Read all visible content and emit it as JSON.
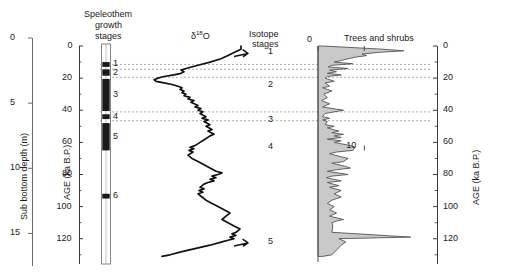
{
  "figure": {
    "headers": {
      "speleothem": [
        "Speleothem",
        "growth",
        "stages"
      ],
      "isotope_curve": "δ18O",
      "isotope_stages": [
        "Isotope",
        "stages"
      ],
      "pollen": "Trees and shrubs"
    },
    "axes": {
      "depth": {
        "label": "Sub bottom depth (m)",
        "ticks": [
          0,
          5,
          10,
          15
        ],
        "unit": "m",
        "range": [
          0,
          17.5
        ]
      },
      "age_left": {
        "label": "AGE (ka B.P.)",
        "ticks": [
          0,
          20,
          40,
          60,
          80,
          100,
          120
        ],
        "minor_ticks": [
          10,
          30,
          50,
          70,
          90,
          110,
          130
        ],
        "unit": "ka B.P.",
        "range": [
          0,
          132
        ]
      },
      "age_right": {
        "label": "AGE (ka B.P.)",
        "ticks": [
          0,
          20,
          40,
          60,
          80,
          100,
          120
        ],
        "minor_ticks": [
          10,
          30,
          50,
          70,
          90,
          110,
          130
        ],
        "unit": "ka B.P.",
        "range": [
          0,
          132
        ]
      },
      "pollen_x": {
        "ticks": [
          0,
          10
        ],
        "range": [
          0,
          22
        ]
      }
    },
    "growth_stages": {
      "numbers": [
        "1",
        "2",
        "3",
        "4",
        "5",
        "6"
      ],
      "bands": [
        {
          "label": "1",
          "top_age": 10.0,
          "bottom_age": 13.0,
          "fill": "#1a1a1a"
        },
        {
          "label": "2",
          "top_age": 14.5,
          "bottom_age": 18.5,
          "fill": "#1a1a1a"
        },
        {
          "label": "3",
          "top_age": 20.5,
          "bottom_age": 40.5,
          "fill": "#1a1a1a"
        },
        {
          "label": "4",
          "top_age": 42.5,
          "bottom_age": 45.5,
          "fill": "#1a1a1a"
        },
        {
          "label": "5",
          "top_age": 48.0,
          "bottom_age": 65.0,
          "fill": "#1a1a1a"
        },
        {
          "label": "6",
          "top_age": 92.0,
          "bottom_age": 95.0,
          "fill": "#1a1a1a"
        }
      ]
    },
    "isotope_stage_labels": [
      {
        "text": "1",
        "age": 4
      },
      {
        "text": "2",
        "age": 24
      },
      {
        "text": "3",
        "age": 46
      },
      {
        "text": "4",
        "age": 63
      },
      {
        "text": "5",
        "age": 122
      }
    ],
    "correlation_lines_age": [
      11.5,
      14.5,
      19.5,
      41.0,
      46.5
    ],
    "colors": {
      "curve": "#111111",
      "pollen_fill": "#c9c9c9",
      "pollen_stroke": "#555555",
      "axis": "#6a6a6a",
      "dashed": "#9a9a9a",
      "text": "#1a1a1a"
    }
  },
  "chart_data": [
    {
      "type": "line",
      "title": "δ18O",
      "xlabel": "δ18O",
      "ylabel": "AGE (ka B.P.)",
      "ylim": [
        0,
        132
      ],
      "xlim": [
        0,
        1
      ],
      "orientation": "vertical-depth",
      "note": "x increases to the right; values are relative plot positions read off the curve",
      "points": [
        [
          0.93,
          0
        ],
        [
          0.93,
          2
        ],
        [
          0.86,
          4
        ],
        [
          0.8,
          6
        ],
        [
          0.73,
          8
        ],
        [
          0.62,
          10
        ],
        [
          0.5,
          12
        ],
        [
          0.38,
          14
        ],
        [
          0.33,
          15
        ],
        [
          0.36,
          16
        ],
        [
          0.33,
          17
        ],
        [
          0.26,
          18
        ],
        [
          0.16,
          19
        ],
        [
          0.1,
          20
        ],
        [
          0.06,
          21
        ],
        [
          0.08,
          22
        ],
        [
          0.16,
          23
        ],
        [
          0.24,
          24
        ],
        [
          0.3,
          25
        ],
        [
          0.34,
          26
        ],
        [
          0.32,
          27
        ],
        [
          0.36,
          28
        ],
        [
          0.34,
          29
        ],
        [
          0.38,
          30
        ],
        [
          0.36,
          31
        ],
        [
          0.42,
          32
        ],
        [
          0.4,
          33
        ],
        [
          0.46,
          34
        ],
        [
          0.43,
          35
        ],
        [
          0.5,
          37
        ],
        [
          0.47,
          38
        ],
        [
          0.53,
          39
        ],
        [
          0.5,
          40
        ],
        [
          0.55,
          41
        ],
        [
          0.52,
          42
        ],
        [
          0.58,
          44
        ],
        [
          0.54,
          45
        ],
        [
          0.6,
          46
        ],
        [
          0.56,
          47
        ],
        [
          0.62,
          49
        ],
        [
          0.58,
          50
        ],
        [
          0.64,
          52
        ],
        [
          0.6,
          53
        ],
        [
          0.66,
          55
        ],
        [
          0.62,
          56
        ],
        [
          0.57,
          58
        ],
        [
          0.52,
          60
        ],
        [
          0.47,
          62
        ],
        [
          0.42,
          63
        ],
        [
          0.46,
          64
        ],
        [
          0.41,
          65
        ],
        [
          0.45,
          66
        ],
        [
          0.4,
          68
        ],
        [
          0.44,
          70
        ],
        [
          0.5,
          72
        ],
        [
          0.56,
          74
        ],
        [
          0.62,
          76
        ],
        [
          0.68,
          78
        ],
        [
          0.74,
          79
        ],
        [
          0.7,
          80
        ],
        [
          0.64,
          81
        ],
        [
          0.68,
          82
        ],
        [
          0.62,
          83
        ],
        [
          0.66,
          84
        ],
        [
          0.6,
          85
        ],
        [
          0.56,
          86
        ],
        [
          0.52,
          88
        ],
        [
          0.56,
          89
        ],
        [
          0.51,
          90
        ],
        [
          0.55,
          91
        ],
        [
          0.5,
          92
        ],
        [
          0.54,
          94
        ],
        [
          0.58,
          96
        ],
        [
          0.64,
          98
        ],
        [
          0.7,
          100
        ],
        [
          0.76,
          102
        ],
        [
          0.82,
          104
        ],
        [
          0.78,
          106
        ],
        [
          0.74,
          108
        ],
        [
          0.8,
          110
        ],
        [
          0.86,
          112
        ],
        [
          0.92,
          114
        ],
        [
          0.88,
          116
        ],
        [
          0.84,
          117
        ],
        [
          0.88,
          118
        ],
        [
          0.82,
          119
        ],
        [
          0.86,
          120
        ],
        [
          0.8,
          121
        ],
        [
          0.74,
          122
        ],
        [
          0.62,
          124
        ],
        [
          0.48,
          126
        ],
        [
          0.34,
          128
        ],
        [
          0.22,
          130
        ],
        [
          0.14,
          131
        ]
      ]
    },
    {
      "type": "area",
      "title": "Trees and shrubs",
      "xlabel": "Trees and shrubs",
      "ylabel": "AGE (ka B.P.)",
      "ylim": [
        0,
        132
      ],
      "xlim": [
        0,
        22
      ],
      "xticks": [
        0,
        10
      ],
      "orientation": "vertical-depth",
      "points": [
        [
          1.0,
          0
        ],
        [
          14.0,
          2
        ],
        [
          18.5,
          3
        ],
        [
          13.0,
          4
        ],
        [
          9.5,
          5
        ],
        [
          10.5,
          6
        ],
        [
          8.0,
          7
        ],
        [
          6.5,
          8
        ],
        [
          5.0,
          9
        ],
        [
          3.5,
          10
        ],
        [
          7.5,
          11
        ],
        [
          3.0,
          12
        ],
        [
          2.2,
          13
        ],
        [
          6.5,
          14
        ],
        [
          2.5,
          15
        ],
        [
          4.0,
          16
        ],
        [
          2.0,
          17
        ],
        [
          5.0,
          18
        ],
        [
          2.0,
          19
        ],
        [
          1.5,
          20
        ],
        [
          3.5,
          22
        ],
        [
          1.5,
          23
        ],
        [
          2.5,
          25
        ],
        [
          1.0,
          26
        ],
        [
          3.0,
          28
        ],
        [
          1.2,
          30
        ],
        [
          2.0,
          32
        ],
        [
          0.8,
          34
        ],
        [
          2.5,
          36
        ],
        [
          1.0,
          38
        ],
        [
          5.5,
          40
        ],
        [
          1.5,
          42
        ],
        [
          1.0,
          44
        ],
        [
          2.5,
          45
        ],
        [
          1.0,
          46
        ],
        [
          2.0,
          47
        ],
        [
          1.5,
          49
        ],
        [
          3.5,
          50
        ],
        [
          2.0,
          51
        ],
        [
          4.5,
          53
        ],
        [
          3.0,
          54
        ],
        [
          5.5,
          55
        ],
        [
          3.5,
          56
        ],
        [
          5.0,
          57
        ],
        [
          2.0,
          58
        ],
        [
          5.0,
          59
        ],
        [
          3.5,
          60
        ],
        [
          7.0,
          62
        ],
        [
          8.0,
          63
        ],
        [
          7.5,
          65
        ],
        [
          4.0,
          66
        ],
        [
          2.5,
          67
        ],
        [
          5.0,
          69
        ],
        [
          6.5,
          70
        ],
        [
          5.5,
          72
        ],
        [
          3.0,
          73
        ],
        [
          6.0,
          75
        ],
        [
          7.0,
          76
        ],
        [
          4.0,
          77
        ],
        [
          2.0,
          78
        ],
        [
          6.5,
          80
        ],
        [
          3.0,
          81
        ],
        [
          1.8,
          82
        ],
        [
          5.0,
          84
        ],
        [
          2.0,
          85
        ],
        [
          4.5,
          87
        ],
        [
          2.5,
          88
        ],
        [
          5.0,
          90
        ],
        [
          3.5,
          92
        ],
        [
          5.0,
          94
        ],
        [
          3.0,
          96
        ],
        [
          2.0,
          98
        ],
        [
          3.5,
          100
        ],
        [
          2.5,
          102
        ],
        [
          4.0,
          104
        ],
        [
          2.5,
          106
        ],
        [
          5.5,
          108
        ],
        [
          4.0,
          109
        ],
        [
          3.0,
          110
        ],
        [
          3.2,
          112
        ],
        [
          3.0,
          116
        ],
        [
          20.0,
          119
        ],
        [
          4.5,
          120
        ],
        [
          6.0,
          122
        ],
        [
          5.0,
          124
        ],
        [
          4.0,
          127
        ],
        [
          3.0,
          130
        ],
        [
          1.0,
          131
        ]
      ]
    }
  ]
}
